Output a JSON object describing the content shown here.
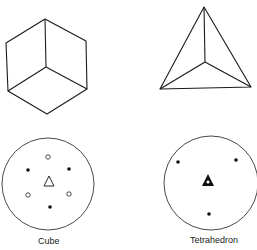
{
  "figures": [
    {
      "name": "Cube",
      "label": "Cube",
      "polyhedron": {
        "vertices": {
          "top": [
            45,
            19
          ],
          "upper_left": [
            6,
            43
          ],
          "upper_right": [
            86,
            41
          ],
          "center": [
            46,
            67
          ],
          "lower_left": [
            8,
            91
          ],
          "lower_right": [
            87,
            89
          ],
          "bottom": [
            47,
            114
          ]
        }
      },
      "stereogram": {
        "circle": {
          "cx": 48,
          "cy": 184,
          "r": 46
        },
        "filled_dots": [
          [
            28,
            170
          ],
          [
            69,
            169
          ],
          [
            50,
            207
          ]
        ],
        "open_dots": [
          [
            48,
            157
          ],
          [
            28,
            195
          ],
          [
            69,
            194
          ]
        ],
        "center_symbol": "open-triangle"
      }
    },
    {
      "name": "Tetrahedron",
      "label": "Tetrahedron",
      "polyhedron": {
        "vertices": {
          "apex": [
            204,
            7
          ],
          "left": [
            160,
            89
          ],
          "right": [
            251,
            87
          ],
          "center": [
            205,
            62
          ]
        }
      },
      "stereogram": {
        "circle": {
          "cx": 211,
          "cy": 183,
          "r": 47
        },
        "filled_dots": [
          [
            178,
            162
          ],
          [
            236,
            160
          ],
          [
            209,
            214
          ]
        ],
        "open_dots": [],
        "center_symbol": "filled-triangle-with-dot"
      }
    }
  ]
}
